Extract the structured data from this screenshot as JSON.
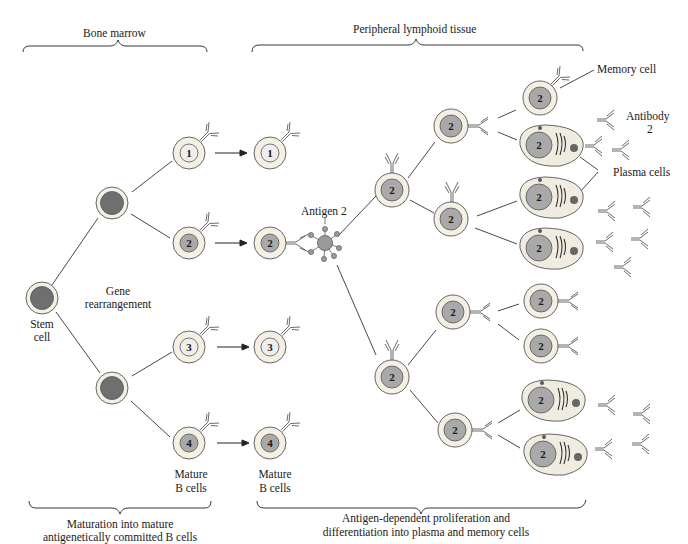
{
  "diagram": {
    "colors": {
      "background": "#ffffff",
      "cell_cytoplasm": "#f4f1e4",
      "stem_nucleus": "#6f6f6f",
      "nucleus_light": "#eeeeee",
      "nucleus_dark": "#a9a9a9",
      "antigen": "#9a9a9a",
      "line": "#333333"
    },
    "regions": {
      "bone_marrow": "Bone marrow",
      "peripheral": "Peripheral lymphoid tissue"
    },
    "labels": {
      "stem_cell_1": "Stem",
      "stem_cell_2": "cell",
      "gene_1": "Gene",
      "gene_2": "rearrangement",
      "antigen": "Antigen 2",
      "mature_a_1": "Mature",
      "mature_a_2": "B cells",
      "mature_b_1": "Mature",
      "mature_b_2": "B cells",
      "memory_cell": "Memory cell",
      "antibody_1": "Antibody",
      "antibody_2": "2",
      "plasma_cells": "Plasma cells"
    },
    "captions": {
      "left_1": "Maturation into mature",
      "left_2": "antigenetically committed B cells",
      "right_1": "Antigen-dependent proliferation and",
      "right_2": "differentiation into plasma and memory cells"
    },
    "nodes": [
      {
        "id": "stem",
        "type": "stem",
        "x": 42,
        "y": 298
      },
      {
        "id": "progenitor-top",
        "type": "stem",
        "x": 112,
        "y": 203
      },
      {
        "id": "progenitor-bottom",
        "type": "stem",
        "x": 112,
        "y": 388
      },
      {
        "id": "bm-1",
        "type": "bcell",
        "label": "1",
        "shade": "light",
        "x": 189,
        "y": 153
      },
      {
        "id": "bm-2",
        "type": "bcell",
        "label": "2",
        "shade": "dark",
        "x": 189,
        "y": 243
      },
      {
        "id": "bm-3",
        "type": "bcell",
        "label": "3",
        "shade": "light",
        "x": 189,
        "y": 347
      },
      {
        "id": "bm-4",
        "type": "bcell",
        "label": "4",
        "shade": "dark",
        "x": 189,
        "y": 443
      },
      {
        "id": "pl-1",
        "type": "bcell",
        "label": "1",
        "shade": "light",
        "x": 270,
        "y": 153
      },
      {
        "id": "pl-2",
        "type": "bcell",
        "label": "2",
        "shade": "dark",
        "x": 270,
        "y": 243
      },
      {
        "id": "pl-3",
        "type": "bcell",
        "label": "3",
        "shade": "light",
        "x": 270,
        "y": 347
      },
      {
        "id": "pl-4",
        "type": "bcell",
        "label": "4",
        "shade": "dark",
        "x": 270,
        "y": 443
      },
      {
        "id": "act-top",
        "type": "bcell",
        "label": "2",
        "shade": "dark",
        "x": 392,
        "y": 190
      },
      {
        "id": "act-bottom",
        "type": "bcell",
        "label": "2",
        "shade": "dark",
        "x": 392,
        "y": 377
      },
      {
        "id": "g2-a",
        "type": "bcell",
        "label": "2",
        "shade": "dark",
        "x": 451,
        "y": 126
      },
      {
        "id": "g2-b",
        "type": "bcell",
        "label": "2",
        "shade": "dark",
        "x": 451,
        "y": 219
      },
      {
        "id": "g2-c",
        "type": "bcell",
        "label": "2",
        "shade": "dark",
        "x": 453,
        "y": 312
      },
      {
        "id": "g2-d",
        "type": "bcell",
        "label": "2",
        "shade": "dark",
        "x": 455,
        "y": 430
      },
      {
        "id": "memory-top",
        "type": "bcell",
        "label": "2",
        "shade": "dark",
        "x": 540,
        "y": 98
      },
      {
        "id": "plasma-1",
        "type": "plasma",
        "label": "2",
        "x": 540,
        "y": 145
      },
      {
        "id": "plasma-2",
        "type": "plasma",
        "label": "2",
        "x": 540,
        "y": 197
      },
      {
        "id": "plasma-3",
        "type": "plasma",
        "label": "2",
        "x": 540,
        "y": 248
      },
      {
        "id": "memory-2",
        "type": "bcell",
        "label": "2",
        "shade": "dark",
        "x": 541,
        "y": 301
      },
      {
        "id": "memory-3",
        "type": "bcell",
        "label": "2",
        "shade": "dark",
        "x": 541,
        "y": 346
      },
      {
        "id": "plasma-4",
        "type": "plasma",
        "label": "2",
        "x": 542,
        "y": 400
      },
      {
        "id": "plasma-5",
        "type": "plasma",
        "label": "2",
        "x": 544,
        "y": 454
      }
    ]
  }
}
